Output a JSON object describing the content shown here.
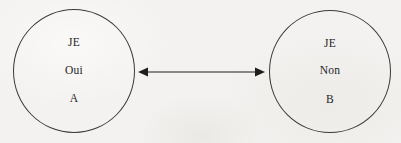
{
  "diagram": {
    "type": "two-node-bidirectional",
    "background_color": "#f3f2f0",
    "stroke_color": "#3b3a37",
    "text_color": "#1f1e1c",
    "nodes": [
      {
        "id": "A",
        "shape": "circle",
        "lines": [
          "JE",
          "Oui",
          "A"
        ]
      },
      {
        "id": "B",
        "shape": "circle",
        "lines": [
          "JE",
          "Non",
          "B"
        ]
      }
    ],
    "connector": {
      "name": "double-headed-arrow",
      "direction": "bidirectional",
      "label": "",
      "color": "#1f1e1c"
    }
  }
}
